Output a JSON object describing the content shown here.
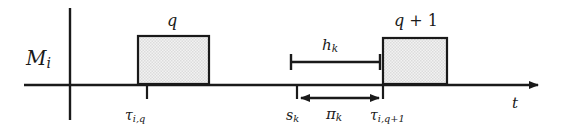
{
  "figure": {
    "type": "gantt-timeline-diagram",
    "background_color": "#ffffff",
    "line_color": "#1a1a1a",
    "box_fill_color": "#e2e2e2",
    "box_border_color": "#1a1a1a"
  },
  "axes": {
    "vertical": {
      "name": "machine-axis",
      "label": "M",
      "label_sub": "i",
      "x": 70,
      "y_top": 8,
      "y_bottom": 120
    },
    "horizontal": {
      "name": "time-axis",
      "label": "t",
      "y": 85,
      "x_start": 24,
      "x_end": 545,
      "arrow": "right"
    }
  },
  "operations": [
    {
      "id": "job-q",
      "label": "q",
      "label_plain": "q",
      "x": 138,
      "y": 36,
      "width": 71,
      "height": 48,
      "start_tick_x": 147
    },
    {
      "id": "job-q-plus-1",
      "label": "q + 1",
      "label_plain": "q+1",
      "x": 383,
      "y": 38,
      "width": 64,
      "height": 46,
      "start_tick_x": 383
    }
  ],
  "ticks": [
    {
      "id": "tau-i-q",
      "symbol": "τ",
      "subscript": "i,q",
      "x": 147,
      "label_x": 125
    },
    {
      "id": "s-k",
      "symbol": "s",
      "subscript": "k",
      "x": 297,
      "label_x": 286
    },
    {
      "id": "tau-i-q-plus-1",
      "symbol": "τ",
      "subscript": "i,q+1",
      "x": 383,
      "label_x": 370
    }
  ],
  "intervals": [
    {
      "id": "h-k",
      "symbol": "h",
      "subscript": "k",
      "label_plain": "h_k",
      "x_start": 291,
      "x_end": 380,
      "y": 62,
      "style": "bar-with-serif-caps",
      "position": "above-axis"
    },
    {
      "id": "pi-k",
      "symbol": "π",
      "subscript": "k",
      "label_plain": "pi_k",
      "x_start": 300,
      "x_end": 381,
      "y": 98,
      "style": "double-headed-arrow",
      "position": "below-axis"
    }
  ],
  "labels": {
    "machine": {
      "symbol": "M",
      "subscript": "i"
    },
    "time": {
      "symbol": "t"
    },
    "job_q": {
      "text": "q"
    },
    "job_q_plus_1": {
      "base": "q",
      "op": " + ",
      "num": "1"
    },
    "hk": {
      "symbol": "h",
      "subscript": "k"
    },
    "pik": {
      "symbol": "π",
      "subscript": "k"
    },
    "tau_iq": {
      "symbol": "τ",
      "subscript": "i,q"
    },
    "sk": {
      "symbol": "s",
      "subscript": "k"
    },
    "tau_iq1": {
      "symbol": "τ",
      "subscript": "i,q+1"
    }
  }
}
